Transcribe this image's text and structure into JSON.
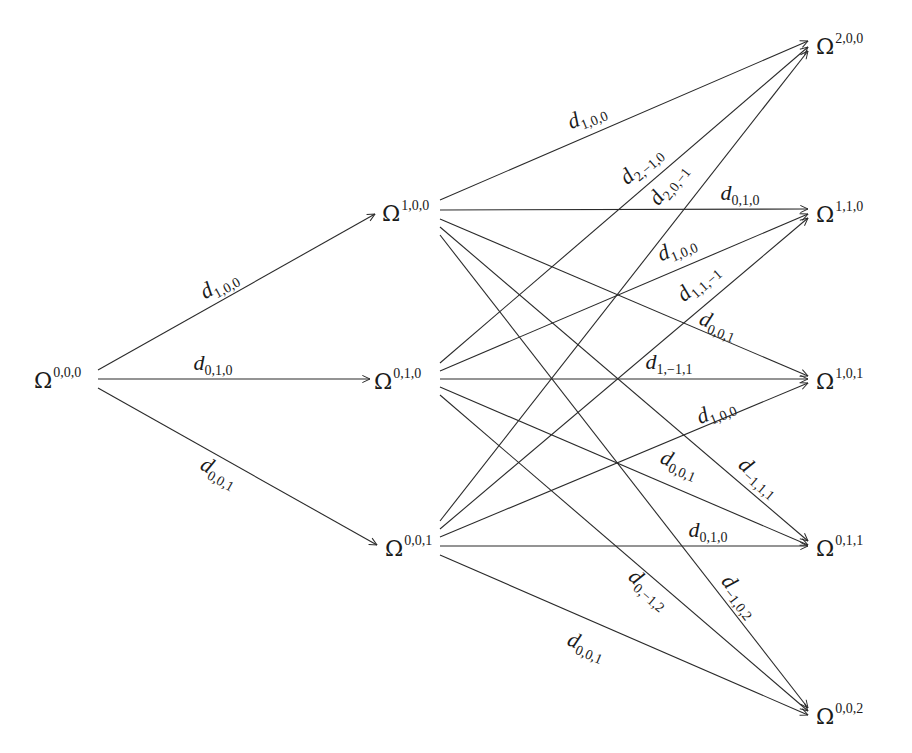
{
  "diagram": {
    "type": "directed-graph",
    "stroke_color": "#2a2a2a",
    "text_color": "#1a1a1a",
    "background": "#ffffff",
    "nodes": [
      {
        "id": "n000",
        "symbol": "Ω",
        "sup": "0,0,0",
        "x": 34,
        "y": 380,
        "ax": 96,
        "ay": 380
      },
      {
        "id": "n100",
        "symbol": "Ω",
        "sup": "1,0,0",
        "x": 382,
        "y": 213,
        "ax": 437,
        "ay": 212
      },
      {
        "id": "n010",
        "symbol": "Ω",
        "sup": "0,1,0",
        "x": 374,
        "y": 381,
        "ax": 437,
        "ay": 380
      },
      {
        "id": "n001",
        "symbol": "Ω",
        "sup": "0,0,1",
        "x": 385,
        "y": 548,
        "ax": 437,
        "ay": 547
      },
      {
        "id": "n200",
        "symbol": "Ω",
        "sup": "2,0,0",
        "x": 816,
        "y": 46,
        "ax": 810,
        "ay": 44
      },
      {
        "id": "n110",
        "symbol": "Ω",
        "sup": "1,1,0",
        "x": 816,
        "y": 214,
        "ax": 810,
        "ay": 212
      },
      {
        "id": "n101",
        "symbol": "Ω",
        "sup": "1,0,1",
        "x": 816,
        "y": 381,
        "ax": 810,
        "ay": 379
      },
      {
        "id": "n011",
        "symbol": "Ω",
        "sup": "0,1,1",
        "x": 816,
        "y": 548,
        "ax": 810,
        "ay": 546
      },
      {
        "id": "n002",
        "symbol": "Ω",
        "sup": "0,0,2",
        "x": 816,
        "y": 716,
        "ax": 810,
        "ay": 714
      }
    ],
    "edges": [
      {
        "from": "n000",
        "to": "n100",
        "sx": 98,
        "sy": 370,
        "ex": 375,
        "ey": 214,
        "label": "d",
        "sub": "1,0,0",
        "lx": 222,
        "ly": 290,
        "rot": -29
      },
      {
        "from": "n000",
        "to": "n010",
        "sx": 98,
        "sy": 379,
        "ex": 370,
        "ey": 379,
        "label": "d",
        "sub": "0,1,0",
        "lx": 213,
        "ly": 370,
        "rot": 0
      },
      {
        "from": "n000",
        "to": "n001",
        "sx": 98,
        "sy": 388,
        "ex": 377,
        "ey": 545,
        "label": "d",
        "sub": "0,0,1",
        "lx": 216,
        "ly": 478,
        "rot": 29
      },
      {
        "from": "n100",
        "to": "n200",
        "sx": 440,
        "sy": 200,
        "ex": 808,
        "ey": 41,
        "label": "d",
        "sub": "1,0,0",
        "lx": 589,
        "ly": 122,
        "rot": -22
      },
      {
        "from": "n100",
        "to": "n110",
        "sx": 440,
        "sy": 210,
        "ex": 808,
        "ey": 209,
        "label": "d",
        "sub": "0,1,0",
        "lx": 740,
        "ly": 200,
        "rot": 0
      },
      {
        "from": "n100",
        "to": "n101",
        "sx": 440,
        "sy": 219,
        "ex": 808,
        "ey": 376,
        "label": "d",
        "sub": "0,0,1",
        "lx": 716,
        "ly": 331,
        "rot": 22
      },
      {
        "from": "n100",
        "to": "n011",
        "sx": 440,
        "sy": 227,
        "ex": 808,
        "ey": 541,
        "label": "d",
        "sub": "-1,1,1",
        "lx": 755,
        "ly": 482,
        "rot": 41
      },
      {
        "from": "n100",
        "to": "n002",
        "sx": 440,
        "sy": 235,
        "ex": 808,
        "ey": 708,
        "label": "d",
        "sub": "-1,0,2",
        "lx": 735,
        "ly": 600,
        "rot": 52
      },
      {
        "from": "n010",
        "to": "n200",
        "sx": 440,
        "sy": 363,
        "ex": 808,
        "ey": 47,
        "label": "d",
        "sub": "2,-1,0",
        "lx": 645,
        "ly": 170,
        "rot": -41
      },
      {
        "from": "n010",
        "to": "n110",
        "sx": 440,
        "sy": 371,
        "ex": 808,
        "ey": 214,
        "label": "d",
        "sub": "1,0,0",
        "lx": 679,
        "ly": 254,
        "rot": -23
      },
      {
        "from": "n010",
        "to": "n101",
        "sx": 440,
        "sy": 379,
        "ex": 808,
        "ey": 379,
        "label": "d",
        "sub": "1,-1,1",
        "lx": 669,
        "ly": 369,
        "rot": 0
      },
      {
        "from": "n010",
        "to": "n011",
        "sx": 440,
        "sy": 387,
        "ex": 808,
        "ey": 545,
        "label": "d",
        "sub": "0,0,1",
        "lx": 677,
        "ly": 470,
        "rot": 23
      },
      {
        "from": "n010",
        "to": "n002",
        "sx": 440,
        "sy": 395,
        "ex": 808,
        "ey": 711,
        "label": "d",
        "sub": "0,-1,2",
        "lx": 645,
        "ly": 594,
        "rot": 41
      },
      {
        "from": "n001",
        "to": "n200",
        "sx": 440,
        "sy": 521,
        "ex": 808,
        "ey": 51,
        "label": "d",
        "sub": "2,0,-1",
        "lx": 673,
        "ly": 188,
        "rot": -52
      },
      {
        "from": "n001",
        "to": "n110",
        "sx": 440,
        "sy": 529,
        "ex": 808,
        "ey": 218,
        "label": "d",
        "sub": "1,1,-1",
        "lx": 702,
        "ly": 287,
        "rot": -41
      },
      {
        "from": "n001",
        "to": "n101",
        "sx": 440,
        "sy": 537,
        "ex": 808,
        "ey": 383,
        "label": "d",
        "sub": "1,0,0",
        "lx": 718,
        "ly": 417,
        "rot": -22
      },
      {
        "from": "n001",
        "to": "n011",
        "sx": 440,
        "sy": 546,
        "ex": 808,
        "ey": 546,
        "label": "d",
        "sub": "0,1,0",
        "lx": 708,
        "ly": 537,
        "rot": 0
      },
      {
        "from": "n001",
        "to": "n002",
        "sx": 440,
        "sy": 555,
        "ex": 808,
        "ey": 715,
        "label": "d",
        "sub": "0,0,1",
        "lx": 584,
        "ly": 652,
        "rot": 23
      }
    ]
  }
}
